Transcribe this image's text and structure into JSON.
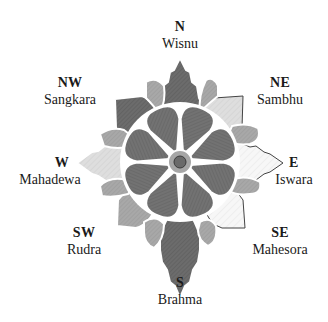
{
  "diagram": {
    "center_hub": true,
    "petal_count": 8,
    "colors": {
      "petal": "#6e6e6e",
      "petal_light": "#8a8a8a",
      "cardinal_leaf_n_s": "#6a6a6a",
      "cardinal_leaf_w": "#d4d4d4",
      "cardinal_leaf_e": "#ffffff",
      "diagonal_leaf_light": "#d9d9d9",
      "diagonal_leaf_mid": "#a6a6a6",
      "diagonal_leaf_dark": "#777777",
      "outline": "#ffffff",
      "stroke": "#333333",
      "text": "#1a1a1a"
    }
  },
  "directions": [
    {
      "key": "N",
      "abbr": "N",
      "deity": "Wisnu"
    },
    {
      "key": "NE",
      "abbr": "NE",
      "deity": "Sambhu"
    },
    {
      "key": "E",
      "abbr": "E",
      "deity": "Iswara"
    },
    {
      "key": "SE",
      "abbr": "SE",
      "deity": "Mahesora"
    },
    {
      "key": "S",
      "abbr": "S",
      "deity": "Brahma"
    },
    {
      "key": "SW",
      "abbr": "SW",
      "deity": "Rudra"
    },
    {
      "key": "W",
      "abbr": "W",
      "deity": "Mahadewa"
    },
    {
      "key": "NW",
      "abbr": "NW",
      "deity": "Sangkara"
    }
  ]
}
